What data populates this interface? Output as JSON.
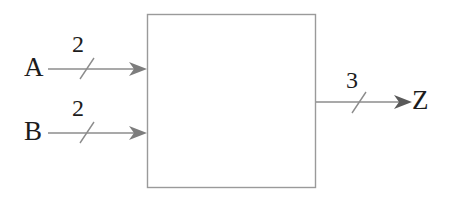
{
  "diagram": {
    "type": "block-diagram",
    "background_color": "#ffffff",
    "line_color": "#8c8c8c",
    "text_color": "#1c1c1c",
    "block": {
      "label": "",
      "x": 147,
      "y": 14,
      "width": 169,
      "height": 174,
      "fill": "#ffffff",
      "stroke": "#9a9a9a"
    },
    "inputs": [
      {
        "name": "A",
        "label": "A",
        "bus_width": "2",
        "y": 69,
        "line_start_x": 48,
        "line_end_x": 147,
        "slash_x": 86
      },
      {
        "name": "B",
        "label": "B",
        "bus_width": "2",
        "y": 133,
        "line_start_x": 48,
        "line_end_x": 147,
        "slash_x": 86
      }
    ],
    "outputs": [
      {
        "name": "Z",
        "label": "Z",
        "bus_width": "3",
        "y": 102,
        "line_start_x": 316,
        "line_end_x": 412,
        "slash_x": 359
      }
    ]
  }
}
